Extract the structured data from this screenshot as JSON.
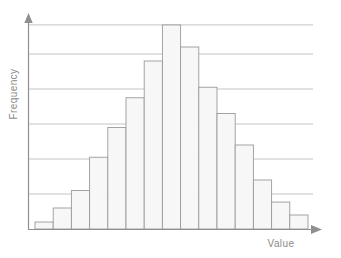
{
  "chart_data": {
    "type": "bar",
    "title": "",
    "subtitle": "",
    "xlabel": "Value",
    "ylabel": "Frequency",
    "categories": [
      "1",
      "2",
      "3",
      "4",
      "5",
      "6",
      "7",
      "8",
      "9",
      "10",
      "11",
      "12",
      "13",
      "14",
      "15"
    ],
    "values": [
      0.2,
      0.6,
      1.1,
      2.05,
      2.9,
      3.75,
      4.8,
      5.83,
      5.2,
      4.05,
      3.3,
      2.4,
      1.4,
      0.77,
      0.4
    ],
    "ylim": [
      0,
      5.83
    ],
    "xlim": [
      0,
      15
    ],
    "grid": true,
    "gridlines_y": [
      1,
      2,
      3,
      4,
      5,
      5.83
    ],
    "tick_labels_x": [],
    "tick_labels_y": [],
    "legend": [],
    "legend_position": "none",
    "annotations": []
  },
  "style": {
    "bar_fill": "#f7f7f7",
    "bar_stroke": "#9a9a9a",
    "grid_color": "#bdbdbd",
    "axis_color": "#8f8f8f",
    "label_color": "#8a8a8a",
    "background": "#ffffff"
  },
  "axes": {
    "x_axis_name": "Value",
    "y_axis_name": "Frequency",
    "x_arrow": "arrow-right",
    "y_arrow": "arrow-up"
  }
}
